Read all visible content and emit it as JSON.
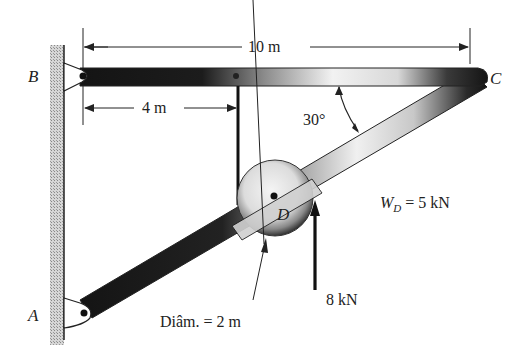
{
  "figure": {
    "points": {
      "A": "A",
      "B": "B",
      "C": "C",
      "D": "D"
    },
    "dimensions": {
      "total_length": "10 m",
      "pulley_offset": "4 m",
      "angle": "30°",
      "diameter": "Diâm. = 2 m"
    },
    "loads": {
      "weight_symbol": "W",
      "weight_subscript": "D",
      "weight_value": "= 5 kN",
      "force": "8 kN"
    },
    "colors": {
      "member_dark": "#1a1a1a",
      "member_light": "#e8e8e8",
      "wall_hatch": "#b0b0b0",
      "line": "#222222"
    }
  }
}
